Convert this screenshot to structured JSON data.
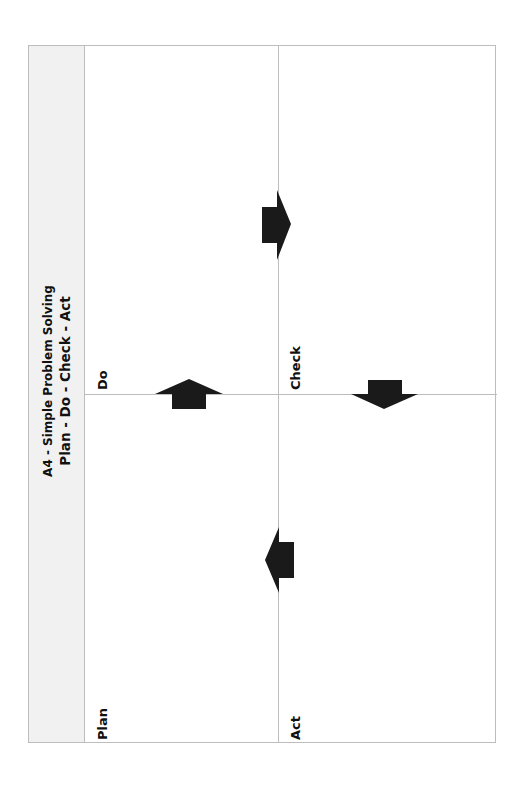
{
  "sidebar": {
    "title_line1": "A4 - Simple Problem Solving",
    "title_line2": "Plan - Do - Check - Act"
  },
  "quadrants": [
    {
      "id": "plan",
      "label": "Plan"
    },
    {
      "id": "do",
      "label": "Do"
    },
    {
      "id": "check",
      "label": "Check"
    },
    {
      "id": "act",
      "label": "Act"
    }
  ],
  "arrows": [
    {
      "from": "plan",
      "to": "do",
      "direction": "up"
    },
    {
      "from": "do",
      "to": "check",
      "direction": "right"
    },
    {
      "from": "check",
      "to": "act",
      "direction": "down"
    },
    {
      "from": "act",
      "to": "plan",
      "direction": "left"
    }
  ],
  "colors": {
    "border": "#bdbdbd",
    "sidebar_bg": "#f1f1f1",
    "arrow": "#1a1a1a",
    "text": "#111111"
  }
}
